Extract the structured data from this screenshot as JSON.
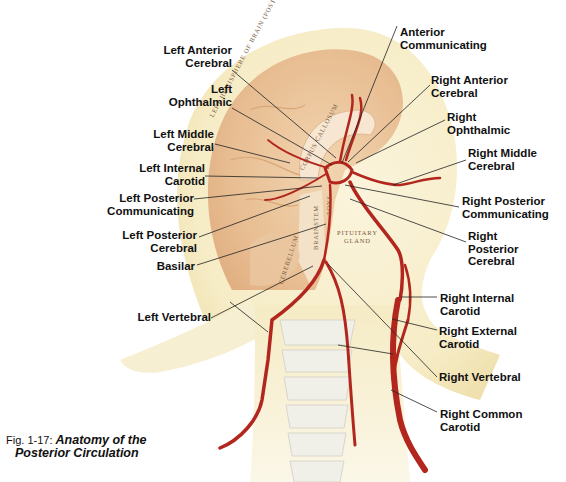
{
  "figure": {
    "number": "Fig. 1-17:",
    "title_line1": "Anatomy of the",
    "title_line2": "Posterior Circulation"
  },
  "anatomy_labels": {
    "hemisphere": "LEFT HEMISPHERE OF BRAIN (POSTERO-MEDIAL VIEW)",
    "corpus_callosum": "CORPUS CALLOSUM",
    "brainstem": "BRAINSTEM",
    "pons": "PONS",
    "pituitary_line1": "PITUITARY",
    "pituitary_line2": "GLAND",
    "cerebellum": "CEREBELLUM"
  },
  "left_labels": [
    {
      "line1": "Left Anterior",
      "line2": "Cerebral"
    },
    {
      "line1": "Left",
      "line2": "Ophthalmic"
    },
    {
      "line1": "Left Middle",
      "line2": "Cerebral"
    },
    {
      "line1": "Left Internal",
      "line2": "Carotid"
    },
    {
      "line1": "Left Posterior",
      "line2": "Communicating"
    },
    {
      "line1": "Left Posterior",
      "line2": "Cerebral"
    },
    {
      "line1": "Basilar"
    },
    {
      "line1": "Left Vertebral"
    }
  ],
  "right_labels": [
    {
      "line1": "Anterior",
      "line2": "Communicating"
    },
    {
      "line1": "Right Anterior",
      "line2": "Cerebral"
    },
    {
      "line1": "Right",
      "line2": "Ophthalmic"
    },
    {
      "line1": "Right Middle",
      "line2": "Cerebral"
    },
    {
      "line1": "Right Posterior",
      "line2": "Communicating"
    },
    {
      "line1": "Right",
      "line2": "Posterior",
      "line3": "Cerebral"
    },
    {
      "line1": "Right Internal",
      "line2": "Carotid"
    },
    {
      "line1": "Right External",
      "line2": "Carotid"
    },
    {
      "line1": "Right Vertebral"
    },
    {
      "line1": "Right Common",
      "line2": "Carotid"
    }
  ],
  "colors": {
    "artery": "#b3261e",
    "brain": "#e9c39a",
    "head": "#f7efcf",
    "leader": "#222222"
  }
}
